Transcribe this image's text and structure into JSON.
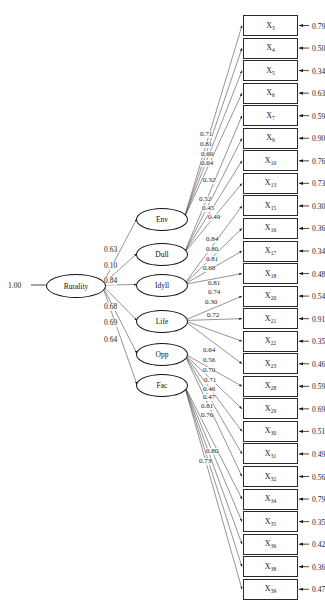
{
  "diagram": {
    "type": "sem-path-diagram",
    "title": "",
    "root": {
      "name": "Rurality",
      "fixed_value": "1.00"
    },
    "factors": [
      {
        "name": "Env",
        "path_coefficient": "0.63"
      },
      {
        "name": "Dull",
        "path_coefficient": "0.10"
      },
      {
        "name": "Idyll",
        "path_coefficient": "0.84"
      },
      {
        "name": "Life",
        "path_coefficient": "0.68"
      },
      {
        "name": "Opp",
        "path_coefficient": "0.69"
      },
      {
        "name": "Fac",
        "path_coefficient": "0.64"
      }
    ],
    "structural_path_labels": [
      "0.63",
      "0.10",
      "0.84",
      "0.68",
      "0.69",
      "0.64"
    ],
    "indicators": [
      {
        "label": "X",
        "subscript": "3",
        "residual": "0.79"
      },
      {
        "label": "X",
        "subscript": "4",
        "residual": "0.50"
      },
      {
        "label": "X",
        "subscript": "5",
        "residual": "0.34"
      },
      {
        "label": "X",
        "subscript": "6",
        "residual": "0.63"
      },
      {
        "label": "X",
        "subscript": "7",
        "residual": "0.59"
      },
      {
        "label": "X",
        "subscript": "9",
        "residual": "0.90"
      },
      {
        "label": "X",
        "subscript": "10",
        "residual": "0.76"
      },
      {
        "label": "X",
        "subscript": "13",
        "residual": "0.73"
      },
      {
        "label": "X",
        "subscript": "15",
        "residual": "0.30"
      },
      {
        "label": "X",
        "subscript": "16",
        "residual": "0.36"
      },
      {
        "label": "X",
        "subscript": "17",
        "residual": "0.34"
      },
      {
        "label": "X",
        "subscript": "18",
        "residual": "0.48"
      },
      {
        "label": "X",
        "subscript": "20",
        "residual": "0.54"
      },
      {
        "label": "X",
        "subscript": "21",
        "residual": "0.91"
      },
      {
        "label": "X",
        "subscript": "22",
        "residual": "0.35"
      },
      {
        "label": "X",
        "subscript": "23",
        "residual": "0.46"
      },
      {
        "label": "X",
        "subscript": "28",
        "residual": "0.59"
      },
      {
        "label": "X",
        "subscript": "29",
        "residual": "0.69"
      },
      {
        "label": "X",
        "subscript": "30",
        "residual": "0.51"
      },
      {
        "label": "X",
        "subscript": "31",
        "residual": "0.49"
      },
      {
        "label": "X",
        "subscript": "32",
        "residual": "0.56"
      },
      {
        "label": "X",
        "subscript": "34",
        "residual": "0.79"
      },
      {
        "label": "X",
        "subscript": "35",
        "residual": "0.35"
      },
      {
        "label": "X",
        "subscript": "36",
        "residual": "0.42"
      },
      {
        "label": "X",
        "subscript": "38",
        "residual": "0.36"
      },
      {
        "label": "X",
        "subscript": "39",
        "residual": "0.47"
      }
    ],
    "loading_labels": [
      "0.71",
      "0.81",
      "0.60",
      "0.64",
      "0.32",
      "0.52",
      "0.45",
      "0.49",
      "0.84",
      "0.80",
      "0.81",
      "0.68",
      "0.81",
      "0.74",
      "0.30",
      "0.72",
      "0.64",
      "0.56",
      "0.70",
      "0.71",
      "0.46",
      "0.47",
      "0.81",
      "0.76",
      "0.80",
      "0.73"
    ]
  },
  "chart_data": {
    "type": "diagram",
    "nodes": {
      "second_order": [
        "Rurality"
      ],
      "first_order": [
        "Env",
        "Dull",
        "Idyll",
        "Life",
        "Opp",
        "Fac"
      ],
      "observed": [
        "X3",
        "X4",
        "X5",
        "X6",
        "X7",
        "X9",
        "X10",
        "X13",
        "X15",
        "X16",
        "X17",
        "X18",
        "X20",
        "X21",
        "X22",
        "X23",
        "X28",
        "X29",
        "X30",
        "X31",
        "X32",
        "X34",
        "X35",
        "X36",
        "X38",
        "X39"
      ]
    },
    "structural_paths": [
      {
        "from": "Rurality",
        "to": "Env",
        "estimate": 0.63
      },
      {
        "from": "Rurality",
        "to": "Dull",
        "estimate": -0.1
      },
      {
        "from": "Rurality",
        "to": "Idyll",
        "estimate": 0.84
      },
      {
        "from": "Rurality",
        "to": "Life",
        "estimate": 0.68
      },
      {
        "from": "Rurality",
        "to": "Opp",
        "estimate": 0.69
      },
      {
        "from": "Rurality",
        "to": "Fac",
        "estimate": 0.64
      }
    ],
    "measurement_loadings": [
      {
        "indicator": "X3",
        "estimate": 0.71,
        "residual": 0.79
      },
      {
        "indicator": "X4",
        "estimate": 0.81,
        "residual": 0.5
      },
      {
        "indicator": "X5",
        "estimate": 0.6,
        "residual": 0.34
      },
      {
        "indicator": "X6",
        "estimate": 0.64,
        "residual": 0.63
      },
      {
        "indicator": "X7",
        "estimate": 0.32,
        "residual": 0.59
      },
      {
        "indicator": "X9",
        "estimate": 0.52,
        "residual": 0.9
      },
      {
        "indicator": "X10",
        "estimate": 0.45,
        "residual": 0.76
      },
      {
        "indicator": "X13",
        "estimate": 0.49,
        "residual": 0.73
      },
      {
        "indicator": "X15",
        "estimate": 0.84,
        "residual": 0.3
      },
      {
        "indicator": "X16",
        "estimate": 0.8,
        "residual": 0.36
      },
      {
        "indicator": "X17",
        "estimate": 0.81,
        "residual": 0.34
      },
      {
        "indicator": "X18",
        "estimate": 0.68,
        "residual": 0.48
      },
      {
        "indicator": "X20",
        "estimate": 0.81,
        "residual": 0.54
      },
      {
        "indicator": "X21",
        "estimate": 0.74,
        "residual": 0.91
      },
      {
        "indicator": "X22",
        "estimate": 0.3,
        "residual": 0.35
      },
      {
        "indicator": "X23",
        "estimate": 0.72,
        "residual": 0.46
      },
      {
        "indicator": "X28",
        "estimate": 0.64,
        "residual": 0.59
      },
      {
        "indicator": "X29",
        "estimate": 0.56,
        "residual": 0.69
      },
      {
        "indicator": "X30",
        "estimate": 0.7,
        "residual": 0.51
      },
      {
        "indicator": "X31",
        "estimate": 0.71,
        "residual": 0.49
      },
      {
        "indicator": "X32",
        "estimate": 0.46,
        "residual": 0.56
      },
      {
        "indicator": "X34",
        "estimate": 0.47,
        "residual": 0.79
      },
      {
        "indicator": "X35",
        "estimate": 0.81,
        "residual": 0.35
      },
      {
        "indicator": "X36",
        "estimate": 0.76,
        "residual": 0.42
      },
      {
        "indicator": "X38",
        "estimate": 0.8,
        "residual": 0.36
      },
      {
        "indicator": "X39",
        "estimate": 0.73,
        "residual": 0.47
      }
    ],
    "fixed_parameters": [
      {
        "label": "1.00",
        "attached_to": "Rurality"
      }
    ]
  }
}
